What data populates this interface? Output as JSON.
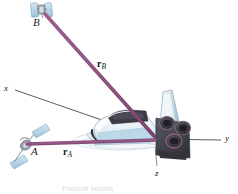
{
  "figure": {
    "kind": "engineering-mechanics-vector-diagram",
    "background_color": "#ffffff",
    "caption": "Position vectors",
    "labels": {
      "point_b": "B",
      "point_a": "A",
      "axis_x": "x",
      "axis_y": "y",
      "axis_z": "z",
      "vector_b_symbol": "r",
      "vector_b_subscript": "B",
      "vector_a_symbol": "r",
      "vector_a_subscript": "A"
    },
    "colors": {
      "vector_purple": "#8c4f7d",
      "vector_purple_dark": "#6e3b62",
      "axis_line": "#4a4a4a",
      "shuttle_body_light": "#e9f2f8",
      "shuttle_body_blue": "#bcd9ea",
      "shuttle_shadow": "#9fb6c6",
      "cargo_bay_dark": "#3b3b42",
      "engine_dark": "#43434c",
      "engine_ring": "#6b5a68",
      "satellite_panel": "#b9d6e8",
      "satellite_panel_edge": "#7ba5bf",
      "satellite_body": "#8f8f9c",
      "text": "#1a1a1a"
    },
    "geometry": {
      "origin": {
        "x": 152,
        "y": 138
      },
      "point_b": {
        "x": 43,
        "y": 12
      },
      "point_a": {
        "x": 30,
        "y": 143
      },
      "axis_x_end": {
        "x": 13,
        "y": 90
      },
      "axis_y_end": {
        "x": 222,
        "y": 140
      },
      "axis_z_end": {
        "x": 157,
        "y": 166
      }
    },
    "objects": [
      {
        "name": "satellite-b",
        "label": "B",
        "position": "top-left"
      },
      {
        "name": "satellite-a",
        "label": "A",
        "position": "lower-left"
      },
      {
        "name": "space-shuttle",
        "label": "",
        "position": "center-right"
      }
    ]
  }
}
